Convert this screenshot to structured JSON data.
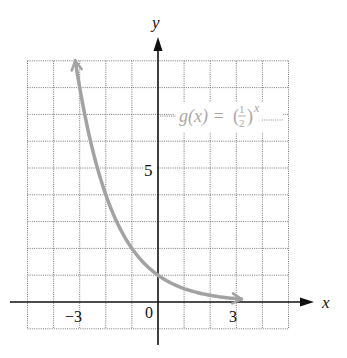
{
  "chart_data": {
    "type": "line",
    "title": "",
    "xlabel": "x",
    "ylabel": "y",
    "xlim": [
      -5,
      5
    ],
    "ylim": [
      -1,
      9
    ],
    "grid": true,
    "grid_step": 1,
    "x_tick_labels": [
      {
        "value": -3,
        "label": "−3"
      },
      {
        "value": 0,
        "label": "0"
      },
      {
        "value": 3,
        "label": "3"
      }
    ],
    "y_tick_labels": [
      {
        "value": 5,
        "label": "5"
      }
    ],
    "series": [
      {
        "name": "g(x) = (1/2)^x",
        "function": "(1/2)^x",
        "color": "#a2a2a2",
        "x": [
          -3.17,
          -3,
          -2,
          -1,
          0,
          1,
          2,
          3,
          3.2
        ],
        "y": [
          9.0,
          8,
          4,
          2,
          1,
          0.5,
          0.25,
          0.125,
          0.109
        ],
        "arrows": "both"
      }
    ],
    "annotations": [
      {
        "text": "g(x) = (1/2)^x",
        "x": 2.2,
        "y": 7,
        "color": "#a8a8a8"
      }
    ]
  },
  "labels": {
    "x_axis": "x",
    "y_axis": "y",
    "tick_neg3": "−3",
    "tick_0": "0",
    "tick_3": "3",
    "tick_y5": "5",
    "fn_prefix": "g(x) = (",
    "fn_num": "1",
    "fn_den": "2",
    "fn_close": ")",
    "fn_exp": "x"
  }
}
